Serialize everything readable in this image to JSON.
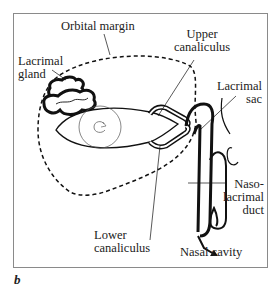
{
  "figure": {
    "panel_letter": "b",
    "frame_color": "#8a8a8a",
    "stroke_color": "#111111"
  },
  "labels": {
    "orbital_margin": "Orbital margin",
    "lacrimal_gland_line1": "Lacrimal",
    "lacrimal_gland_line2": "gland",
    "upper_canaliculus_line1": "Upper",
    "upper_canaliculus_line2": "canaliculus",
    "lacrimal_sac_line1": "Lacrimal",
    "lacrimal_sac_line2": "sac",
    "nasolacrimal_duct_line1": "Naso-",
    "nasolacrimal_duct_line2": "lacrimal",
    "nasolacrimal_duct_line3": "duct",
    "lower_canaliculus_line1": "Lower",
    "lower_canaliculus_line2": "canaliculus",
    "nasal_cavity": "Nasal cavity"
  }
}
